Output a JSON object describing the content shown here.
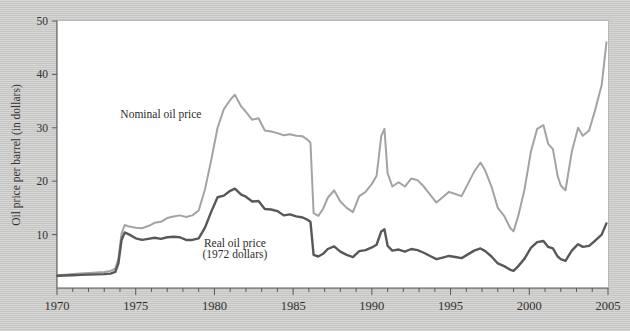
{
  "figure": {
    "background_color": "#c9c9c7",
    "plot_background_color": "#ffffff"
  },
  "chart_data": {
    "type": "line",
    "title": "",
    "xlabel": "",
    "ylabel": "Oil price per barrel (in dollars)",
    "xlim": [
      1970,
      2005
    ],
    "ylim": [
      0,
      50
    ],
    "grid": false,
    "legend_position": "inline-annotations",
    "x_ticks": [
      1970,
      1975,
      1980,
      1985,
      1990,
      1995,
      2000,
      2005
    ],
    "x_tick_labels": [
      "1970",
      "1975",
      "1980",
      "1985",
      "1990",
      "1995",
      "2000",
      "2005"
    ],
    "x_minor_tick_interval": 1,
    "y_ticks": [
      10,
      20,
      30,
      40,
      50
    ],
    "y_tick_labels": [
      "10",
      "20",
      "30",
      "40",
      "50"
    ],
    "annotations": [
      {
        "name": "nominal-oil-price-label",
        "text": "Nominal oil price",
        "x": 1976.6,
        "y": 31.8
      },
      {
        "name": "real-oil-price-label",
        "text": "Real oil price",
        "x": 1981.3,
        "y": 7.6
      },
      {
        "name": "real-oil-price-sublabel",
        "text": "(1972 dollars)",
        "x": 1981.3,
        "y": 5.6
      }
    ],
    "series": [
      {
        "name": "Nominal oil price",
        "color": "#a3a3a1",
        "line_width": 2.0,
        "x": [
          1970.0,
          1970.5,
          1971.0,
          1971.5,
          1972.0,
          1972.5,
          1973.0,
          1973.4,
          1973.7,
          1973.9,
          1974.1,
          1974.3,
          1974.6,
          1975.0,
          1975.4,
          1975.8,
          1976.2,
          1976.6,
          1977.0,
          1977.4,
          1977.8,
          1978.2,
          1978.6,
          1979.0,
          1979.4,
          1979.8,
          1980.2,
          1980.6,
          1981.0,
          1981.3,
          1981.7,
          1982.0,
          1982.4,
          1982.8,
          1983.2,
          1983.6,
          1984.0,
          1984.4,
          1984.8,
          1985.2,
          1985.6,
          1985.9,
          1986.1,
          1986.3,
          1986.6,
          1986.9,
          1987.2,
          1987.6,
          1988.0,
          1988.4,
          1988.8,
          1989.2,
          1989.6,
          1990.0,
          1990.3,
          1990.6,
          1990.8,
          1991.0,
          1991.3,
          1991.7,
          1992.1,
          1992.5,
          1992.9,
          1993.3,
          1993.7,
          1994.1,
          1994.5,
          1994.9,
          1995.3,
          1995.7,
          1996.1,
          1996.5,
          1996.9,
          1997.2,
          1997.6,
          1998.0,
          1998.4,
          1998.8,
          1999.0,
          1999.3,
          1999.7,
          2000.1,
          2000.5,
          2000.9,
          2001.2,
          2001.5,
          2001.8,
          2002.0,
          2002.3,
          2002.7,
          2003.1,
          2003.4,
          2003.8,
          2004.2,
          2004.6,
          2004.9
        ],
        "y": [
          2.4,
          2.5,
          2.6,
          2.7,
          2.8,
          2.9,
          3.0,
          3.2,
          3.6,
          5.5,
          10.2,
          11.8,
          11.5,
          11.3,
          11.2,
          11.6,
          12.2,
          12.4,
          13.1,
          13.4,
          13.6,
          13.3,
          13.6,
          14.5,
          18.5,
          24.0,
          30.0,
          33.5,
          35.2,
          36.2,
          34.0,
          33.0,
          31.5,
          31.8,
          29.5,
          29.3,
          29.0,
          28.6,
          28.8,
          28.5,
          28.4,
          27.8,
          27.2,
          14.0,
          13.5,
          14.8,
          16.9,
          18.3,
          16.2,
          15.0,
          14.2,
          17.2,
          18.0,
          19.5,
          21.0,
          28.5,
          29.8,
          21.5,
          19.0,
          19.8,
          19.0,
          20.5,
          20.2,
          19.0,
          17.5,
          16.0,
          17.0,
          18.0,
          17.6,
          17.2,
          19.5,
          21.8,
          23.5,
          22.0,
          19.0,
          15.0,
          13.5,
          11.2,
          10.6,
          13.5,
          18.5,
          25.5,
          29.8,
          30.5,
          27.0,
          26.0,
          21.0,
          19.2,
          18.3,
          25.5,
          30.0,
          28.5,
          29.5,
          33.5,
          38.0,
          46.0
        ]
      },
      {
        "name": "Real oil price (1972 dollars)",
        "color": "#5a5856",
        "line_width": 2.4,
        "x": [
          1970.0,
          1970.5,
          1971.0,
          1971.5,
          1972.0,
          1972.5,
          1973.0,
          1973.4,
          1973.7,
          1973.9,
          1974.1,
          1974.3,
          1974.6,
          1975.0,
          1975.4,
          1975.8,
          1976.2,
          1976.6,
          1977.0,
          1977.4,
          1977.8,
          1978.2,
          1978.6,
          1979.0,
          1979.4,
          1979.8,
          1980.2,
          1980.6,
          1981.0,
          1981.3,
          1981.7,
          1982.0,
          1982.4,
          1982.8,
          1983.2,
          1983.6,
          1984.0,
          1984.4,
          1984.8,
          1985.2,
          1985.6,
          1985.9,
          1986.1,
          1986.3,
          1986.6,
          1986.9,
          1987.2,
          1987.6,
          1988.0,
          1988.4,
          1988.8,
          1989.2,
          1989.6,
          1990.0,
          1990.3,
          1990.6,
          1990.8,
          1991.0,
          1991.3,
          1991.7,
          1992.1,
          1992.5,
          1992.9,
          1993.3,
          1993.7,
          1994.1,
          1994.5,
          1994.9,
          1995.3,
          1995.7,
          1996.1,
          1996.5,
          1996.9,
          1997.2,
          1997.6,
          1998.0,
          1998.4,
          1998.8,
          1999.0,
          1999.3,
          1999.7,
          2000.1,
          2000.5,
          2000.9,
          2001.2,
          2001.5,
          2001.8,
          2002.0,
          2002.3,
          2002.7,
          2003.1,
          2003.4,
          2003.8,
          2004.2,
          2004.6,
          2004.9
        ],
        "y": [
          2.3,
          2.35,
          2.4,
          2.45,
          2.5,
          2.55,
          2.6,
          2.7,
          3.0,
          4.6,
          9.0,
          10.4,
          10.0,
          9.3,
          9.0,
          9.2,
          9.4,
          9.2,
          9.5,
          9.6,
          9.5,
          9.0,
          9.0,
          9.3,
          11.3,
          14.3,
          17.0,
          17.3,
          18.2,
          18.6,
          17.5,
          17.1,
          16.2,
          16.3,
          14.8,
          14.7,
          14.4,
          13.6,
          13.8,
          13.4,
          13.2,
          12.8,
          12.4,
          6.2,
          5.9,
          6.4,
          7.3,
          7.8,
          6.8,
          6.2,
          5.8,
          6.9,
          7.1,
          7.6,
          8.1,
          10.6,
          11.0,
          7.9,
          7.0,
          7.2,
          6.8,
          7.3,
          7.1,
          6.6,
          6.0,
          5.4,
          5.7,
          6.0,
          5.8,
          5.6,
          6.3,
          7.0,
          7.4,
          6.9,
          5.9,
          4.6,
          4.1,
          3.4,
          3.2,
          4.1,
          5.5,
          7.5,
          8.6,
          8.8,
          7.7,
          7.4,
          5.9,
          5.4,
          5.1,
          7.0,
          8.2,
          7.7,
          7.9,
          8.9,
          10.0,
          12.1
        ]
      }
    ]
  }
}
